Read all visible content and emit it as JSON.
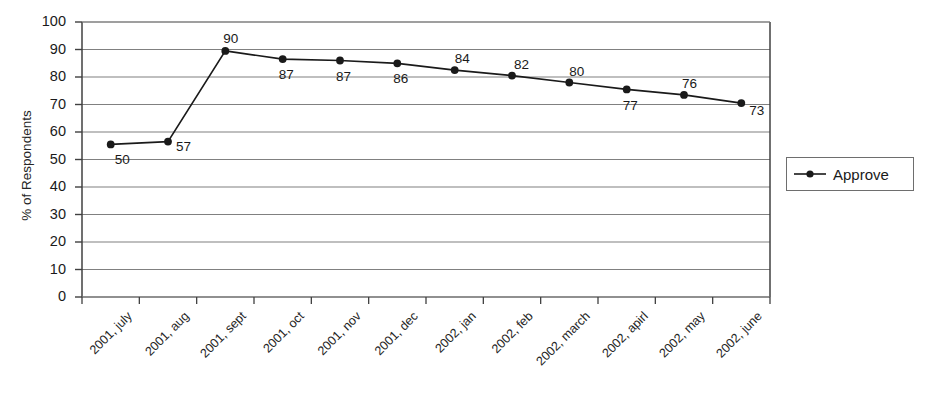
{
  "chart_data": {
    "type": "line",
    "title": "",
    "xlabel": "",
    "ylabel": "% of Respondents",
    "ylim": [
      0,
      100
    ],
    "ytick_step": 10,
    "grid": true,
    "legend_position": "right",
    "categories": [
      "2001, july",
      "2001, aug",
      "2001, sept",
      "2001, oct",
      "2001, nov",
      "2001, dec",
      "2002, jan",
      "2002, feb",
      "2002, march",
      "2002, apirl",
      "2002, may",
      "2002, june"
    ],
    "yticks": [
      "0",
      "10",
      "20",
      "30",
      "40",
      "50",
      "60",
      "70",
      "80",
      "90",
      "100"
    ],
    "series": [
      {
        "name": "Approve",
        "color": "#1a1a1a",
        "marker": "circle",
        "labels": [
          "50",
          "57",
          "90",
          "87",
          "87",
          "86",
          "84",
          "82",
          "80",
          "77",
          "76",
          "73"
        ],
        "values": [
          55.5,
          56.5,
          89.5,
          86.5,
          86,
          85,
          82.5,
          80.5,
          78,
          75.5,
          73.5,
          70.5
        ],
        "label_offsets": [
          {
            "dx": 4,
            "dy": 9
          },
          {
            "dx": 8,
            "dy": -2
          },
          {
            "dx": -2,
            "dy": -19
          },
          {
            "dx": -4,
            "dy": 9
          },
          {
            "dx": -4,
            "dy": 9
          },
          {
            "dx": -4,
            "dy": 9
          },
          {
            "dx": 0,
            "dy": -18
          },
          {
            "dx": 2,
            "dy": -18
          },
          {
            "dx": 0,
            "dy": -18
          },
          {
            "dx": -4,
            "dy": 10
          },
          {
            "dx": -2,
            "dy": -18
          },
          {
            "dx": 8,
            "dy": 1
          }
        ]
      }
    ]
  },
  "legend": {
    "entries": [
      {
        "label": "Approve",
        "color": "#1a1a1a"
      }
    ]
  },
  "axis": {
    "y_title": "% of Respondents"
  },
  "style": {
    "gridline_color": "#808080",
    "axis_color": "#404040",
    "series_color": "#1a1a1a",
    "background": "#ffffff"
  }
}
